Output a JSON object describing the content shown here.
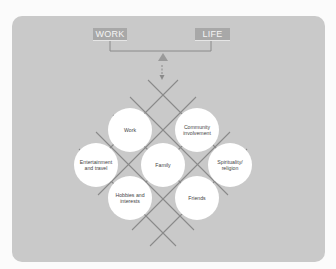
{
  "diagram": {
    "balance": {
      "left_label": "WORK",
      "right_label": "LIFE"
    },
    "nodes": [
      {
        "id": "work",
        "label": "Work"
      },
      {
        "id": "community",
        "label": "Community involvement"
      },
      {
        "id": "entertainment",
        "label": "Entertainment and travel"
      },
      {
        "id": "family",
        "label": "Family"
      },
      {
        "id": "spirituality",
        "label": "Spirituality/ religion"
      },
      {
        "id": "hobbies",
        "label": "Hobbies and interests"
      },
      {
        "id": "friends",
        "label": "Friends"
      }
    ],
    "colors": {
      "page_bg": "#fbfbfb",
      "panel_bg": "#c9c9c9",
      "label_box": "#a8a8a8",
      "lines": "#8a8a8a",
      "circle_fill": "#ffffff"
    }
  }
}
